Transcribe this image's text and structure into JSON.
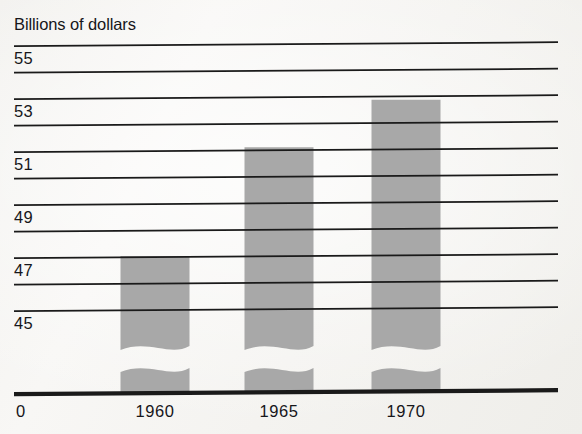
{
  "figure": {
    "title": "Billions of dollars",
    "origin_label": "0",
    "background_color": "#f6f5f3",
    "bar_color": "#a8a8a8",
    "line_color": "#1a1a1a"
  },
  "chart_data": {
    "type": "bar",
    "title": "Billions of dollars",
    "xlabel": "",
    "ylabel": "Billions of dollars",
    "categories": [
      "1960",
      "1965",
      "1970"
    ],
    "values": [
      47.0,
      51.1,
      52.9
    ],
    "ylim": [
      44.0,
      55.6
    ],
    "axis_break": true,
    "axis_break_note": "Y axis is broken below 45; bars show a wavy notch just under the 45 gridline and the baseline is labeled 0.",
    "grid": true,
    "legend": null,
    "y_major_ticks": [
      55,
      53,
      51,
      49,
      47,
      45
    ],
    "y_major_tick_labels": [
      "55",
      "53",
      "51",
      "49",
      "47",
      "45"
    ],
    "y_minor_ticks": [
      54,
      52,
      50,
      48,
      46
    ],
    "gridlines": [
      55,
      54,
      53,
      52,
      51,
      50,
      49,
      48,
      47,
      46,
      45
    ],
    "baseline_label": "0"
  }
}
